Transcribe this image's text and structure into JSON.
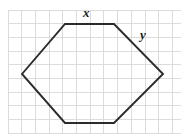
{
  "figure": {
    "canvas": {
      "width": 185,
      "height": 135,
      "background": "#ffffff"
    },
    "grid": {
      "cell_size": 13.7,
      "color": "#d8d8d8",
      "x_start": 8,
      "x_end": 181,
      "y_start": 10,
      "y_end": 133,
      "vertical_lines": [
        8,
        21.7,
        35.4,
        49.1,
        62.8,
        76.5,
        90.2,
        103.9,
        117.6,
        131.3,
        145,
        158.7,
        172.4
      ],
      "horizontal_lines": [
        10,
        23.7,
        37.4,
        51.1,
        64.8,
        78.5,
        92.2,
        105.9,
        119.6,
        133.3
      ]
    },
    "shape": {
      "name": "hexagon",
      "stroke_color": "#2b2b2b",
      "stroke_width": 1.9,
      "fill": "none",
      "vertices": [
        {
          "name": "left",
          "x": 22,
          "y": 74
        },
        {
          "name": "top-left",
          "x": 65,
          "y": 24
        },
        {
          "name": "top-right",
          "x": 114,
          "y": 24
        },
        {
          "name": "right",
          "x": 163,
          "y": 74
        },
        {
          "name": "bottom-right",
          "x": 114,
          "y": 123
        },
        {
          "name": "bottom-left",
          "x": 65,
          "y": 123
        }
      ],
      "points_attr": "22,74 65,24 114,24 163,74 114,123 65,123 22,74"
    },
    "labels": {
      "x": "x",
      "y": "y"
    }
  }
}
